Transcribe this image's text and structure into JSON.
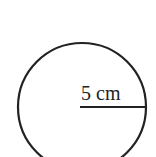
{
  "diagram": {
    "shape": "circle",
    "radius_label": "5 cm",
    "stroke_color": "#222222",
    "background": "#ffffff"
  }
}
